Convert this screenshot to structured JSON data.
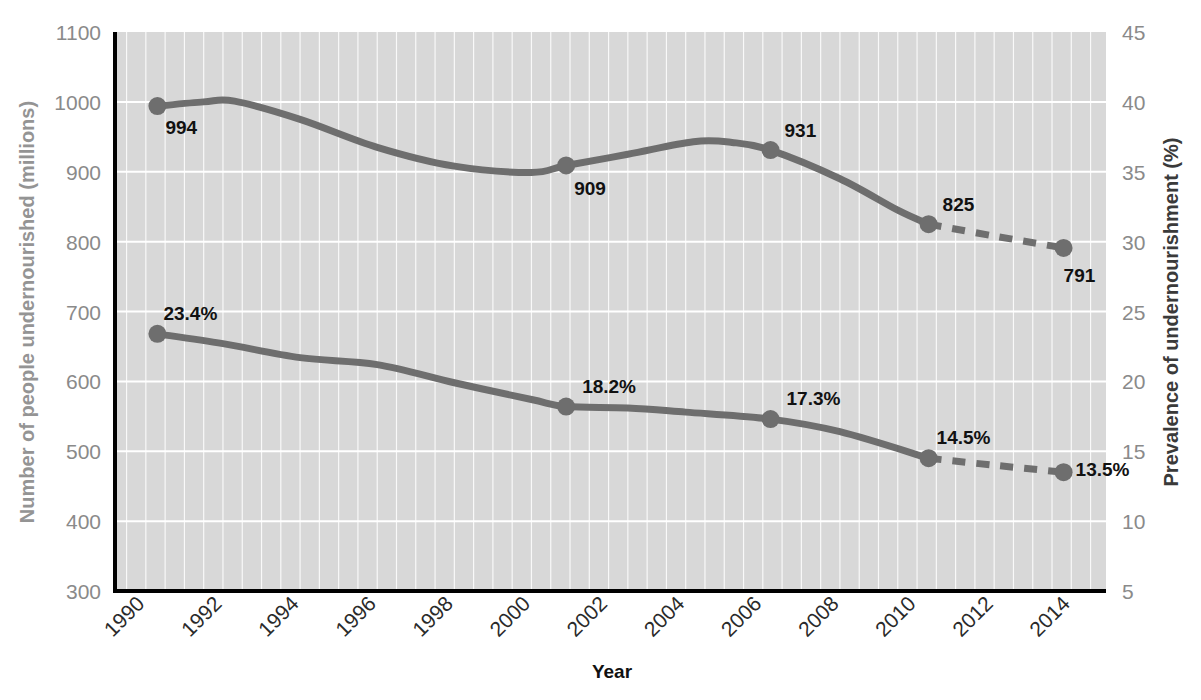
{
  "chart_data": {
    "type": "line",
    "title": "",
    "xlabel": "Year",
    "ylabel": "Number of people undernourished (millions)",
    "y2label": "Prevalence of undernourishment (%)",
    "x": [
      1990,
      1992,
      1994,
      1996,
      1998,
      2000,
      2002,
      2004,
      2006,
      2008,
      2010,
      2012,
      2014
    ],
    "xticklabels": [
      "1990",
      "1992",
      "1994",
      "1996",
      "1998",
      "2000",
      "2002",
      "2004",
      "2006",
      "2008",
      "2010",
      "2012",
      "2014"
    ],
    "xlim": [
      1989.2,
      1914.8
    ],
    "ylim": [
      300,
      1100
    ],
    "yticks": [
      300,
      400,
      500,
      600,
      700,
      800,
      900,
      1000,
      1100
    ],
    "yticklabels": [
      "300",
      "400",
      "500",
      "600",
      "700",
      "800",
      "900",
      "1000",
      "1100"
    ],
    "y2lim": [
      5,
      45
    ],
    "y2ticks": [
      5,
      10,
      15,
      20,
      25,
      30,
      35,
      40,
      45
    ],
    "y2ticklabels": [
      "5",
      "10",
      "15",
      "20",
      "25",
      "30",
      "35",
      "40",
      "45"
    ],
    "grid": true,
    "legend": "none",
    "line_color": "#6e6e6e",
    "plot_background": "#d8d8d8",
    "gridline_color": "#ffffff",
    "series": [
      {
        "name": "Number of people undernourished (millions)",
        "axis": "left",
        "unit": "millions",
        "solid_points": [
          {
            "year": 1990.3,
            "value": 994,
            "label": "994",
            "marker": true
          },
          {
            "year": 1991.5,
            "value": 1000,
            "label": "",
            "marker": false
          },
          {
            "year": 1992.3,
            "value": 1001,
            "label": "",
            "marker": false
          },
          {
            "year": 1994.0,
            "value": 975,
            "label": "",
            "marker": false
          },
          {
            "year": 1996.0,
            "value": 935,
            "label": "",
            "marker": false
          },
          {
            "year": 1998.0,
            "value": 908,
            "label": "",
            "marker": false
          },
          {
            "year": 2000.0,
            "value": 899,
            "label": "",
            "marker": false
          },
          {
            "year": 2000.9,
            "value": 909,
            "label": "909",
            "marker": true
          },
          {
            "year": 2002.5,
            "value": 925,
            "label": "",
            "marker": false
          },
          {
            "year": 2004.2,
            "value": 943,
            "label": "",
            "marker": false
          },
          {
            "year": 2005.2,
            "value": 942,
            "label": "",
            "marker": false
          },
          {
            "year": 2006.2,
            "value": 931,
            "label": "931",
            "marker": true
          },
          {
            "year": 2008.0,
            "value": 890,
            "label": "",
            "marker": false
          },
          {
            "year": 2009.5,
            "value": 845,
            "label": "",
            "marker": false
          },
          {
            "year": 2010.3,
            "value": 825,
            "label": "825",
            "marker": true
          }
        ],
        "dashed_points": [
          {
            "year": 2010.3,
            "value": 825,
            "label": "",
            "marker": false
          },
          {
            "year": 2012.0,
            "value": 808,
            "label": "",
            "marker": false
          },
          {
            "year": 2013.8,
            "value": 791,
            "label": "791",
            "marker": true
          }
        ],
        "labeled_values": [
          {
            "year": 1990,
            "value": 994,
            "label": "994"
          },
          {
            "year": 2001,
            "value": 909,
            "label": "909"
          },
          {
            "year": 2006,
            "value": 931,
            "label": "931"
          },
          {
            "year": 2010,
            "value": 825,
            "label": "825"
          },
          {
            "year": 2014,
            "value": 791,
            "label": "791"
          }
        ]
      },
      {
        "name": "Prevalence of undernourishment (%)",
        "axis": "right",
        "unit": "%",
        "solid_points": [
          {
            "year": 1990.3,
            "value": 23.4,
            "label": "23.4%",
            "marker": true
          },
          {
            "year": 1992.0,
            "value": 22.7,
            "label": "",
            "marker": false
          },
          {
            "year": 1994.0,
            "value": 21.7,
            "label": "",
            "marker": false
          },
          {
            "year": 1996.0,
            "value": 21.2,
            "label": "",
            "marker": false
          },
          {
            "year": 1998.0,
            "value": 19.9,
            "label": "",
            "marker": false
          },
          {
            "year": 2000.0,
            "value": 18.7,
            "label": "",
            "marker": false
          },
          {
            "year": 2000.9,
            "value": 18.2,
            "label": "18.2%",
            "marker": true
          },
          {
            "year": 2002.5,
            "value": 18.1,
            "label": "",
            "marker": false
          },
          {
            "year": 2004.0,
            "value": 17.8,
            "label": "",
            "marker": false
          },
          {
            "year": 2006.2,
            "value": 17.3,
            "label": "17.3%",
            "marker": true
          },
          {
            "year": 2008.0,
            "value": 16.4,
            "label": "",
            "marker": false
          },
          {
            "year": 2010.3,
            "value": 14.5,
            "label": "14.5%",
            "marker": true
          }
        ],
        "dashed_points": [
          {
            "year": 2010.3,
            "value": 14.5,
            "label": "",
            "marker": false
          },
          {
            "year": 2012.0,
            "value": 14.0,
            "label": "",
            "marker": false
          },
          {
            "year": 2013.8,
            "value": 13.5,
            "label": "13.5%",
            "marker": true
          }
        ],
        "labeled_values": [
          {
            "year": 1990,
            "value": 23.4,
            "label": "23.4%"
          },
          {
            "year": 2001,
            "value": 18.2,
            "label": "18.2%"
          },
          {
            "year": 2006,
            "value": 17.3,
            "label": "17.3%"
          },
          {
            "year": 2010,
            "value": 14.5,
            "label": "14.5%"
          },
          {
            "year": 2014,
            "value": 13.5,
            "label": "13.5%"
          }
        ]
      }
    ],
    "annotations": [
      {
        "text": "994",
        "series": "millions",
        "year": 1990
      },
      {
        "text": "909",
        "series": "millions",
        "year": 2001
      },
      {
        "text": "931",
        "series": "millions",
        "year": 2006
      },
      {
        "text": "825",
        "series": "millions",
        "year": 2010
      },
      {
        "text": "791",
        "series": "millions",
        "year": 2014
      },
      {
        "text": "23.4%",
        "series": "percent",
        "year": 1990
      },
      {
        "text": "18.2%",
        "series": "percent",
        "year": 2001
      },
      {
        "text": "17.3%",
        "series": "percent",
        "year": 2006
      },
      {
        "text": "14.5%",
        "series": "percent",
        "year": 2010
      },
      {
        "text": "13.5%",
        "series": "percent",
        "year": 2014
      }
    ]
  },
  "layout": {
    "plot_left": 115,
    "plot_right": 1106,
    "plot_top": 32,
    "plot_bottom": 591,
    "x_min": 1989.2,
    "x_max": 2014.9
  },
  "label_offsets": {
    "millions": [
      {
        "dx": 8,
        "dy": 28
      },
      {
        "dx": 8,
        "dy": 30
      },
      {
        "dx": 14,
        "dy": -13
      },
      {
        "dx": 14,
        "dy": -13
      },
      {
        "dx": 0,
        "dy": 34
      }
    ],
    "percent": [
      {
        "dx": 6,
        "dy": -14
      },
      {
        "dx": 16,
        "dy": -14
      },
      {
        "dx": 16,
        "dy": -14
      },
      {
        "dx": 8,
        "dy": -14
      },
      {
        "dx": 12,
        "dy": 4
      }
    ]
  }
}
